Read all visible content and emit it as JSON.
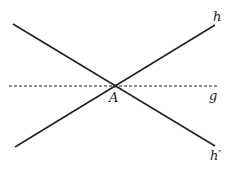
{
  "diagram": {
    "colors": {
      "line": "#222222",
      "background": "#ffffff"
    },
    "lines": [
      {
        "id": "h",
        "style": "solid",
        "x1": 15,
        "y1": 147,
        "x2": 215,
        "y2": 25
      },
      {
        "id": "h-prime",
        "style": "solid",
        "x1": 13,
        "y1": 24,
        "x2": 215,
        "y2": 146
      },
      {
        "id": "g",
        "style": "dashed",
        "x1": 9,
        "y1": 86,
        "x2": 217,
        "y2": 86
      }
    ],
    "point": {
      "label": "A",
      "x": 115,
      "y": 86
    },
    "labels": {
      "h": "h",
      "h_prime": "h′",
      "g": "g",
      "A": "A"
    }
  }
}
